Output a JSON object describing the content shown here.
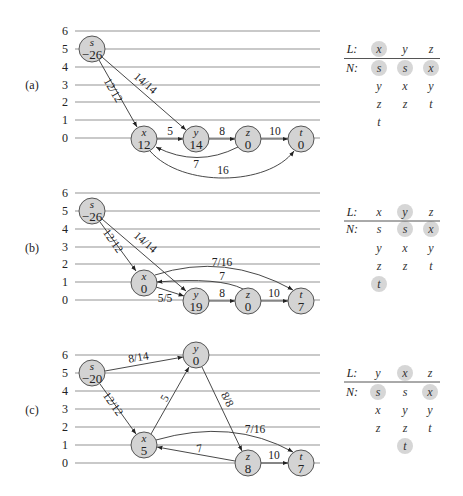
{
  "y_axis_ticks": [
    "6",
    "5",
    "4",
    "3",
    "2",
    "1",
    "0"
  ],
  "diagrams": [
    {
      "label": "(a)",
      "nodes": {
        "s": {
          "name": "s",
          "excess": "−26",
          "height": 5
        },
        "x": {
          "name": "x",
          "excess": "12",
          "height": 0
        },
        "y": {
          "name": "y",
          "excess": "14",
          "height": 0
        },
        "z": {
          "name": "z",
          "excess": "0",
          "height": 0
        },
        "t": {
          "name": "t",
          "excess": "0",
          "height": 0
        }
      },
      "edges": [
        {
          "from": "s",
          "to": "x",
          "label": "12/12"
        },
        {
          "from": "s",
          "to": "y",
          "label": "14/14"
        },
        {
          "from": "x",
          "to": "y",
          "label": "5"
        },
        {
          "from": "y",
          "to": "z",
          "label": "8"
        },
        {
          "from": "z",
          "to": "t",
          "label": "10"
        },
        {
          "from": "z",
          "to": "x",
          "label": "7"
        },
        {
          "from": "x",
          "to": "t",
          "label": "16"
        }
      ],
      "table": {
        "L_label": "L:",
        "N_label": "N:",
        "L": [
          {
            "v": "x",
            "current": true
          },
          {
            "v": "y",
            "current": false
          },
          {
            "v": "z",
            "current": false
          }
        ],
        "N": [
          [
            {
              "v": "s",
              "current": true
            },
            {
              "v": "y"
            },
            {
              "v": "z"
            },
            {
              "v": "t"
            }
          ],
          [
            {
              "v": "s",
              "current": true
            },
            {
              "v": "x"
            },
            {
              "v": "z"
            }
          ],
          [
            {
              "v": "x",
              "current": true
            },
            {
              "v": "y"
            },
            {
              "v": "t"
            }
          ]
        ]
      }
    },
    {
      "label": "(b)",
      "nodes": {
        "s": {
          "name": "s",
          "excess": "−26",
          "height": 5
        },
        "x": {
          "name": "x",
          "excess": "0",
          "height": 1
        },
        "y": {
          "name": "y",
          "excess": "19",
          "height": 0
        },
        "z": {
          "name": "z",
          "excess": "0",
          "height": 0
        },
        "t": {
          "name": "t",
          "excess": "7",
          "height": 0
        }
      },
      "edges": [
        {
          "from": "s",
          "to": "x",
          "label": "12/12"
        },
        {
          "from": "s",
          "to": "y",
          "label": "14/14"
        },
        {
          "from": "x",
          "to": "t",
          "label": "7/16"
        },
        {
          "from": "z",
          "to": "x",
          "label": "7"
        },
        {
          "from": "x",
          "to": "y",
          "label": "5/5"
        },
        {
          "from": "y",
          "to": "z",
          "label": "8"
        },
        {
          "from": "z",
          "to": "t",
          "label": "10"
        }
      ],
      "table": {
        "L_label": "L:",
        "N_label": "N:",
        "L": [
          {
            "v": "x",
            "current": false
          },
          {
            "v": "y",
            "current": true
          },
          {
            "v": "z",
            "current": false
          }
        ],
        "N": [
          [
            {
              "v": "s"
            },
            {
              "v": "y"
            },
            {
              "v": "z"
            },
            {
              "v": "t",
              "current": true
            }
          ],
          [
            {
              "v": "s",
              "current": true
            },
            {
              "v": "x"
            },
            {
              "v": "z"
            }
          ],
          [
            {
              "v": "x",
              "current": true
            },
            {
              "v": "y"
            },
            {
              "v": "t"
            }
          ]
        ]
      }
    },
    {
      "label": "(c)",
      "nodes": {
        "s": {
          "name": "s",
          "excess": "−20",
          "height": 5
        },
        "x": {
          "name": "x",
          "excess": "5",
          "height": 1
        },
        "y": {
          "name": "y",
          "excess": "0",
          "height": 6
        },
        "z": {
          "name": "z",
          "excess": "8",
          "height": 0
        },
        "t": {
          "name": "t",
          "excess": "7",
          "height": 0
        }
      },
      "edges": [
        {
          "from": "s",
          "to": "y",
          "label": "8/14"
        },
        {
          "from": "s",
          "to": "x",
          "label": "12/12"
        },
        {
          "from": "x",
          "to": "y",
          "label": "5"
        },
        {
          "from": "y",
          "to": "z",
          "label": "8/8"
        },
        {
          "from": "x",
          "to": "t",
          "label": "7/16"
        },
        {
          "from": "z",
          "to": "x",
          "label": "7"
        },
        {
          "from": "z",
          "to": "t",
          "label": "10"
        }
      ],
      "table": {
        "L_label": "L:",
        "N_label": "N:",
        "L": [
          {
            "v": "y",
            "current": false
          },
          {
            "v": "x",
            "current": true
          },
          {
            "v": "z",
            "current": false
          }
        ],
        "N": [
          [
            {
              "v": "s",
              "current": true
            },
            {
              "v": "x"
            },
            {
              "v": "z"
            }
          ],
          [
            {
              "v": "s"
            },
            {
              "v": "y"
            },
            {
              "v": "z"
            },
            {
              "v": "t",
              "current": true
            }
          ],
          [
            {
              "v": "x",
              "current": true
            },
            {
              "v": "y"
            },
            {
              "v": "t"
            }
          ]
        ]
      }
    }
  ]
}
